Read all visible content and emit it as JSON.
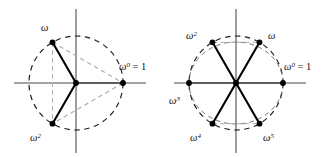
{
  "figure": {
    "colors": {
      "axis": "#808080",
      "circle_dashed": "#1a1a1a",
      "radius_solid": "#000000",
      "chord_dashed_gray": "#a8a8a8",
      "point_fill": "#000000",
      "background": "#ffffff"
    }
  },
  "diagrams": [
    {
      "name": "cube-roots-of-unity",
      "n": 3,
      "center": {
        "x": 76,
        "y": 83
      },
      "radius": 47,
      "points": [
        {
          "key": "w0",
          "label": "ω",
          "sup": "0",
          "suffix": " = 1",
          "angle_deg": 0,
          "label_x": 119,
          "label_y": 70
        },
        {
          "key": "w1",
          "label": "ω",
          "sup": "",
          "suffix": "",
          "angle_deg": 120,
          "label_x": 41,
          "label_y": 31
        },
        {
          "key": "w2",
          "label": "ω",
          "sup": "2",
          "suffix": "",
          "angle_deg": 240,
          "label_x": 30,
          "label_y": 141
        }
      ]
    },
    {
      "name": "sixth-roots-of-unity",
      "n": 6,
      "center": {
        "x": 236,
        "y": 83
      },
      "radius": 47,
      "points": [
        {
          "key": "w0",
          "label": "ω",
          "sup": "0",
          "suffix": " = 1",
          "angle_deg": 0,
          "label_x": 284,
          "label_y": 70
        },
        {
          "key": "w1",
          "label": "ω",
          "sup": "",
          "suffix": "",
          "angle_deg": 60,
          "label_x": 277,
          "label_y": 38
        },
        {
          "key": "w2",
          "label": "ω",
          "sup": "2",
          "suffix": "",
          "angle_deg": 120,
          "label_x": 185,
          "label_y": 38
        },
        {
          "key": "w3",
          "label": "ω",
          "sup": "3",
          "suffix": "",
          "angle_deg": 180,
          "label_x": 170,
          "label_y": 103
        },
        {
          "key": "w4",
          "label": "ω",
          "sup": "4",
          "suffix": "",
          "angle_deg": 240,
          "label_x": 189,
          "label_y": 141
        },
        {
          "key": "w5",
          "label": "ω",
          "sup": "5",
          "suffix": "",
          "angle_deg": 300,
          "label_x": 263,
          "label_y": 141
        }
      ]
    }
  ]
}
